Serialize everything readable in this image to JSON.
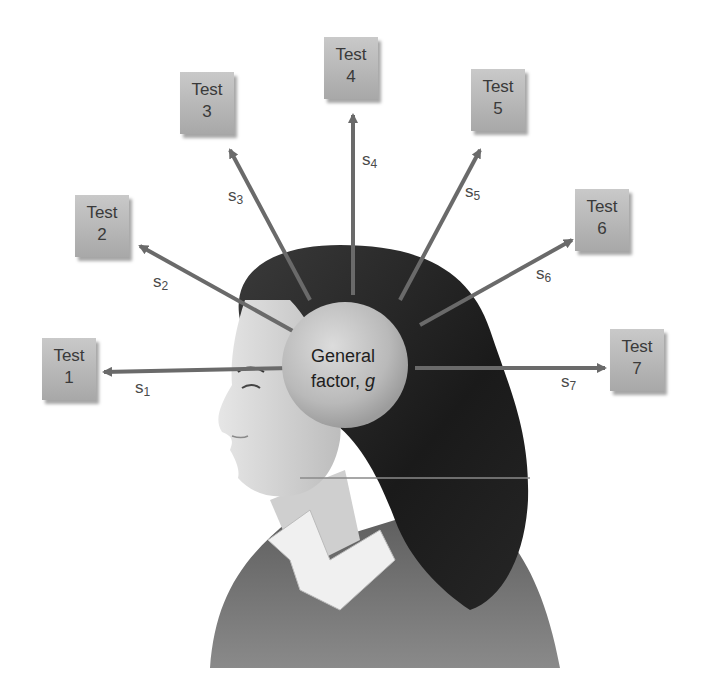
{
  "diagram": {
    "center": {
      "line1": "General",
      "line2": "factor,",
      "symbol": "g"
    },
    "tests": [
      {
        "word": "Test",
        "num": "1",
        "specific": "s",
        "sub": "1"
      },
      {
        "word": "Test",
        "num": "2",
        "specific": "s",
        "sub": "2"
      },
      {
        "word": "Test",
        "num": "3",
        "specific": "s",
        "sub": "3"
      },
      {
        "word": "Test",
        "num": "4",
        "specific": "s",
        "sub": "4"
      },
      {
        "word": "Test",
        "num": "5",
        "specific": "s",
        "sub": "5"
      },
      {
        "word": "Test",
        "num": "6",
        "specific": "s",
        "sub": "6"
      },
      {
        "word": "Test",
        "num": "7",
        "specific": "s",
        "sub": "7"
      }
    ],
    "colors": {
      "arrow": "#6a6a6a",
      "box": "#b5b5b5",
      "sphere": "#bdbdbd",
      "hair": "#1e1e1e",
      "skin": "#d9d9d9"
    }
  }
}
